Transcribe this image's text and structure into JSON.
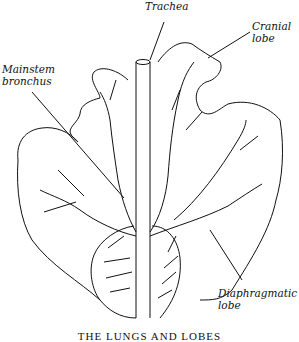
{
  "figure": {
    "labels": {
      "trachea": "Trachea",
      "cranial_lobe": "Cranial\nlobe",
      "mainstem_bronchus": "Mainstem\nbronchus",
      "diaphragmatic_lobe": "Diaphragmatic\nlobe"
    },
    "caption": "THE LUNGS AND LOBES"
  }
}
